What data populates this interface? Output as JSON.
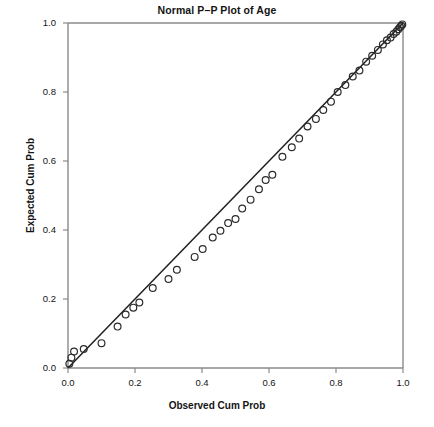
{
  "chart_data": {
    "type": "scatter",
    "title": "Normal P–P Plot of Age",
    "xlabel": "Observed Cum Prob",
    "ylabel": "Expected Cum Prob",
    "xlim": [
      0.0,
      1.0
    ],
    "ylim": [
      0.0,
      1.0
    ],
    "xticks": [
      0.0,
      0.2,
      0.4,
      0.6,
      0.8,
      1.0
    ],
    "yticks": [
      0.0,
      0.2,
      0.4,
      0.6,
      0.8,
      1.0
    ],
    "xtick_labels": [
      "0.0",
      "0.2",
      "0.4",
      "0.6",
      "0.8",
      "1.0"
    ],
    "ytick_labels": [
      "0.0",
      "0.2",
      "0.4",
      "0.6",
      "0.8",
      "1.0"
    ],
    "grid": false,
    "legend": "none",
    "marker": "open-circle",
    "marker_color": "#2b2b2b",
    "marker_radius_px": 3.4,
    "reference_line": {
      "name": "diagonal-reference-line",
      "from": [
        0.0,
        0.0
      ],
      "to": [
        1.0,
        1.0
      ],
      "color": "#1f1f1f"
    },
    "series": [
      {
        "name": "Age",
        "x": [
          0.004,
          0.01,
          0.018,
          0.047,
          0.1,
          0.148,
          0.172,
          0.195,
          0.213,
          0.253,
          0.3,
          0.325,
          0.378,
          0.402,
          0.432,
          0.455,
          0.478,
          0.5,
          0.52,
          0.545,
          0.57,
          0.59,
          0.61,
          0.64,
          0.668,
          0.69,
          0.715,
          0.74,
          0.762,
          0.785,
          0.805,
          0.828,
          0.85,
          0.87,
          0.89,
          0.908,
          0.925,
          0.94,
          0.952,
          0.963,
          0.972,
          0.98,
          0.986,
          0.991,
          0.995,
          0.998
        ],
        "y": [
          0.012,
          0.03,
          0.048,
          0.055,
          0.072,
          0.12,
          0.155,
          0.175,
          0.19,
          0.232,
          0.258,
          0.285,
          0.322,
          0.345,
          0.378,
          0.398,
          0.42,
          0.432,
          0.462,
          0.488,
          0.518,
          0.545,
          0.56,
          0.612,
          0.64,
          0.665,
          0.7,
          0.722,
          0.748,
          0.772,
          0.8,
          0.82,
          0.845,
          0.862,
          0.888,
          0.905,
          0.922,
          0.938,
          0.95,
          0.958,
          0.968,
          0.975,
          0.982,
          0.988,
          0.992,
          0.996
        ]
      }
    ]
  }
}
